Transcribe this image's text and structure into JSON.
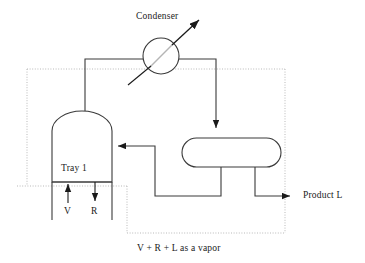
{
  "diagram": {
    "title_caption": "V + R + L as a vapor",
    "labels": {
      "condenser": "Condenser",
      "tray": "Tray 1",
      "vapor_stream": "V",
      "reflux_stream": "R",
      "product": "Product L"
    },
    "equipment": [
      {
        "name": "condenser",
        "shape": "circle-with-diagonal",
        "label": "Condenser"
      },
      {
        "name": "distillation-column",
        "shape": "domed-vessel",
        "label": "Tray 1"
      },
      {
        "name": "reflux-drum",
        "shape": "rounded-rectangle",
        "label": ""
      }
    ],
    "streams": [
      {
        "name": "overhead-vapor",
        "from": "distillation-column",
        "to": "condenser",
        "label": ""
      },
      {
        "name": "condensate",
        "from": "condenser",
        "to": "reflux-drum",
        "label": ""
      },
      {
        "name": "reflux-return",
        "from": "reflux-drum",
        "to": "distillation-column",
        "label": ""
      },
      {
        "name": "product-liquid",
        "from": "reflux-drum",
        "to": "outlet",
        "label": "Product L"
      },
      {
        "name": "boilup-vapor",
        "from": "reboiler",
        "to": "distillation-column",
        "label": "V"
      },
      {
        "name": "tray-liquid",
        "from": "distillation-column",
        "to": "reboiler",
        "label": "R"
      },
      {
        "name": "coolant-out",
        "from": "condenser",
        "to": "outlet",
        "label": ""
      },
      {
        "name": "coolant-in",
        "from": "inlet",
        "to": "condenser",
        "label": ""
      }
    ],
    "control_volume": {
      "name": "control-volume-boundary",
      "style": "dotted",
      "caption": "V + R + L as a vapor"
    },
    "colors": {
      "line": "#3a3a3a",
      "dotted": "#b9b9b9",
      "text": "#1a1a1a",
      "background": "#ffffff"
    }
  }
}
